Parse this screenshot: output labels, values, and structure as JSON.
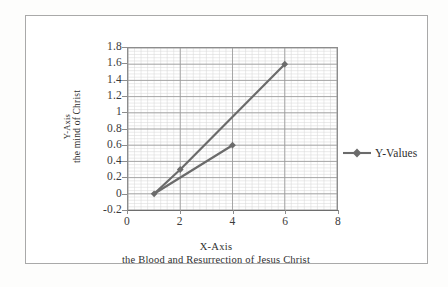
{
  "chart_data": {
    "type": "line",
    "title": "",
    "xlabel": "X-Axis",
    "xlabel_sub": "the Blood and Resurrection of Jesus Christ",
    "ylabel": "Y-Axis",
    "ylabel_sub": "the mind of Christ",
    "xlim": [
      0,
      8
    ],
    "ylim": [
      -0.2,
      1.8
    ],
    "x_ticks": [
      "0",
      "2",
      "4",
      "6",
      "8"
    ],
    "x_tick_values": [
      0,
      2,
      4,
      6,
      8
    ],
    "y_ticks": [
      "1.8",
      "1.6",
      "1.4",
      "1.2",
      "1",
      "0.8",
      "0.6",
      "0.4",
      "0.2",
      "0",
      "-0.2"
    ],
    "y_tick_values": [
      1.8,
      1.6,
      1.4,
      1.2,
      1,
      0.8,
      0.6,
      0.4,
      0.2,
      0,
      -0.2
    ],
    "grid": true,
    "minor_grid": true,
    "legend_position": "right",
    "series": [
      {
        "name": "Y-Values",
        "color": "#6b6b6b",
        "marker": "diamond",
        "segments": [
          {
            "x": [
              1,
              2,
              6
            ],
            "y": [
              0,
              0.3,
              1.6
            ]
          },
          {
            "x": [
              1,
              4
            ],
            "y": [
              0,
              0.6
            ]
          }
        ],
        "points": [
          {
            "x": 1,
            "y": 0
          },
          {
            "x": 2,
            "y": 0.3
          },
          {
            "x": 4,
            "y": 0.6
          },
          {
            "x": 6,
            "y": 1.6
          }
        ]
      }
    ]
  },
  "legend": {
    "entries": [
      {
        "label": "Y-Values"
      }
    ]
  },
  "colors": {
    "series": "#6b6b6b",
    "axis": "#8d8d8d",
    "major_grid": "#9a9a9a",
    "minor_grid": "#d8d8d8",
    "frame": "#a9a9a9",
    "text": "#2f2f2f"
  }
}
